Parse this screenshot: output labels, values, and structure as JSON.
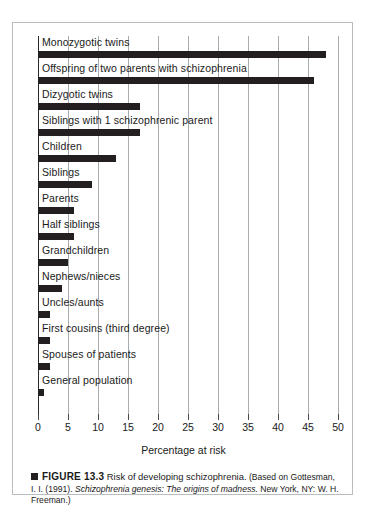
{
  "figure": {
    "caption_marker": "■",
    "label": "FIGURE 13.3",
    "title": "Risk of developing schizophrenia.",
    "source_pre": "(Based on Gottesman, I. I. (1991).",
    "source_italic": "Schizophrenia genesis: The origins of madness.",
    "source_post": "New York, NY: W. H. Freeman.)"
  },
  "chart_data": {
    "type": "bar",
    "orientation": "horizontal",
    "title": "Risk of developing schizophrenia",
    "xlabel": "Percentage at risk",
    "ylabel": "",
    "xlim": [
      0,
      50
    ],
    "xticks": [
      0,
      5,
      10,
      15,
      20,
      25,
      30,
      35,
      40,
      45,
      50
    ],
    "grid": true,
    "legend": false,
    "bar_color": "#231f20",
    "categories": [
      "Monozygotic twins",
      "Offspring of two parents with schizophrenia",
      "Dizygotic twins",
      "Siblings with 1 schizophrenic parent",
      "Children",
      "Siblings",
      "Parents",
      "Half siblings",
      "Grandchildren",
      "Nephews/nieces",
      "Uncles/aunts",
      "First cousins (third degree)",
      "Spouses of patients",
      "General population"
    ],
    "values": [
      48,
      46,
      17,
      17,
      13,
      9,
      6,
      6,
      5,
      4,
      2,
      2,
      2,
      1
    ]
  }
}
